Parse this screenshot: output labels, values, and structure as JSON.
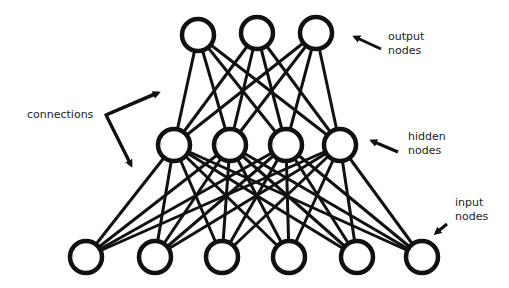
{
  "labels": {
    "output": [
      "output",
      "nodes"
    ],
    "hidden": [
      "hidden",
      "nodes"
    ],
    "input": [
      "input",
      "nodes"
    ],
    "connections": "connections"
  },
  "layers": {
    "output": [
      {
        "x": 198,
        "y": 35
      },
      {
        "x": 257,
        "y": 33
      },
      {
        "x": 316,
        "y": 33
      }
    ],
    "hidden": [
      {
        "x": 174,
        "y": 145
      },
      {
        "x": 230,
        "y": 145
      },
      {
        "x": 286,
        "y": 145
      },
      {
        "x": 340,
        "y": 145
      }
    ],
    "input": [
      {
        "x": 86,
        "y": 257
      },
      {
        "x": 155,
        "y": 257
      },
      {
        "x": 222,
        "y": 257
      },
      {
        "x": 289,
        "y": 257
      },
      {
        "x": 357,
        "y": 257
      },
      {
        "x": 422,
        "y": 257
      }
    ]
  },
  "node_radius": 16,
  "colors": {
    "stroke": "#111111",
    "text": "#222222"
  }
}
